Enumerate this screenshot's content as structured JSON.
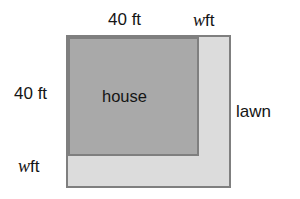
{
  "diagram": {
    "colors": {
      "lawn_fill": "#dcdcdc",
      "house_fill": "#a9a9a9",
      "stroke": "#7f7f7f",
      "text": "#151515",
      "background": "#ffffff"
    },
    "labels": {
      "top_width": "40 ft",
      "top_w_var": "w",
      "top_w_unit": "ft",
      "left_height": "40 ft",
      "bottom_w_var": "w",
      "bottom_w_unit": "ft",
      "lawn": "lawn",
      "house": "house"
    }
  },
  "chart_data": {
    "type": "diagram",
    "shapes": [
      {
        "name": "lawn",
        "label": "lawn",
        "role": "outer-square",
        "fill": "#dcdcdc",
        "stroke": "#7f7f7f",
        "side_expression": "40 + w",
        "side_unit": "ft"
      },
      {
        "name": "house",
        "label": "house",
        "role": "inner-square",
        "fill": "#a9a9a9",
        "stroke": "#7f7f7f",
        "side_value": 40,
        "side_unit": "ft"
      }
    ],
    "dimension_labels": [
      {
        "position": "top-left",
        "text": "40 ft",
        "refers_to": "house width"
      },
      {
        "position": "top-right",
        "text": "w ft",
        "refers_to": "lawn strip width"
      },
      {
        "position": "left",
        "text": "40 ft",
        "refers_to": "house height"
      },
      {
        "position": "bottom-left",
        "text": "w ft",
        "refers_to": "lawn strip height"
      }
    ]
  }
}
